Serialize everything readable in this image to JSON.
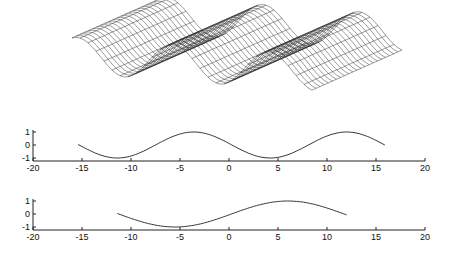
{
  "chart_data": [
    {
      "type": "surface",
      "title": "",
      "description": "3D wireframe mesh of a sinusoidal ridged surface",
      "grid": false
    },
    {
      "type": "line",
      "title": "",
      "xlabel": "",
      "ylabel": "",
      "xlim": [
        -20,
        20
      ],
      "ylim": [
        -1,
        1
      ],
      "xticks": [
        -20,
        -15,
        -10,
        -5,
        0,
        5,
        10,
        15,
        20
      ],
      "yticks": [
        -1,
        0,
        1
      ],
      "series": [
        {
          "name": "curve1",
          "x_start": -15.4,
          "x_end": 15.9,
          "period": 15.6,
          "phase_max_at": -3.6,
          "amplitude": 1,
          "x": [
            -15.4,
            -11.5,
            -7.6,
            -3.6,
            0.2,
            4.0,
            7.9,
            12.0,
            15.9
          ],
          "y": [
            0,
            -1,
            0,
            1,
            0,
            -1,
            0,
            1,
            0
          ]
        }
      ]
    },
    {
      "type": "line",
      "title": "",
      "xlabel": "",
      "ylabel": "",
      "xlim": [
        -20,
        20
      ],
      "ylim": [
        -1,
        1
      ],
      "xticks": [
        -20,
        -15,
        -10,
        -5,
        0,
        5,
        10,
        15,
        20
      ],
      "yticks": [
        -1,
        0,
        1
      ],
      "series": [
        {
          "name": "curve2",
          "x_start": -11.4,
          "x_end": 12.0,
          "period": 23,
          "phase_max_at": 6.0,
          "amplitude": 1,
          "x": [
            -11.4,
            -5.5,
            0.2,
            6.0,
            12.0
          ],
          "y": [
            0,
            -1,
            0,
            1,
            0
          ]
        }
      ]
    }
  ],
  "axes": {
    "xtick_labels": [
      "-20",
      "-15",
      "-10",
      "-5",
      "0",
      "5",
      "10",
      "15",
      "20"
    ],
    "ytick_labels": [
      "1",
      "0",
      "-1"
    ]
  }
}
